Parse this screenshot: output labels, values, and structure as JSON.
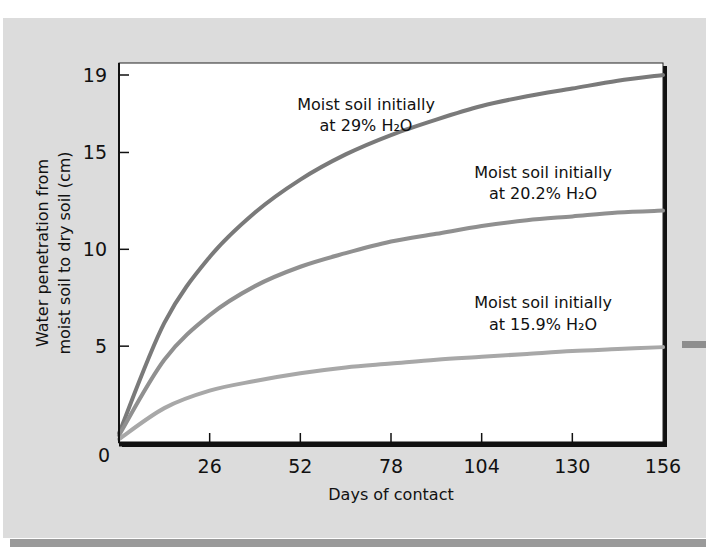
{
  "chart_data": {
    "type": "line",
    "title": "",
    "xlabel": "Days of contact",
    "ylabel": "Water penetration from moist soil to dry soil (cm)",
    "ylabel_lines": [
      "Water penetration from",
      "moist soil to dry soil (cm)"
    ],
    "xlim": [
      0,
      156
    ],
    "ylim": [
      0,
      19
    ],
    "xticks": [
      26,
      52,
      78,
      104,
      130,
      156
    ],
    "yticks": [
      5,
      10,
      15,
      19
    ],
    "origin_label": "0",
    "grid": false,
    "legend": "inline annotations",
    "x": [
      0,
      13,
      26,
      39,
      52,
      65,
      78,
      91,
      104,
      117,
      130,
      143,
      156
    ],
    "series": [
      {
        "name": "Moist soil initially at 29% H2O",
        "label_lines": [
          "Moist soil initially",
          "at 29% H₂O"
        ],
        "color": "#7a7a7a",
        "values": [
          0.5,
          6.2,
          9.6,
          11.9,
          13.6,
          14.9,
          15.9,
          16.7,
          17.4,
          17.9,
          18.3,
          18.7,
          19.0
        ]
      },
      {
        "name": "Moist soil initially at 20.2% H2O",
        "label_lines": [
          "Moist soil initially",
          "at 20.2% H₂O"
        ],
        "color": "#909090",
        "values": [
          0.4,
          4.3,
          6.6,
          8.1,
          9.1,
          9.8,
          10.4,
          10.8,
          11.2,
          11.5,
          11.7,
          11.9,
          12.0
        ]
      },
      {
        "name": "Moist soil initially at 15.9% H2O",
        "label_lines": [
          "Moist soil initially",
          "at 15.9% H₂O"
        ],
        "color": "#a8a8a8",
        "values": [
          0.2,
          1.8,
          2.7,
          3.2,
          3.6,
          3.9,
          4.1,
          4.3,
          4.45,
          4.6,
          4.75,
          4.85,
          4.95
        ]
      }
    ],
    "tick_labels": {
      "x": [
        "26",
        "52",
        "78",
        "104",
        "130",
        "156"
      ],
      "y": [
        "5",
        "10",
        "15",
        "19"
      ]
    }
  }
}
